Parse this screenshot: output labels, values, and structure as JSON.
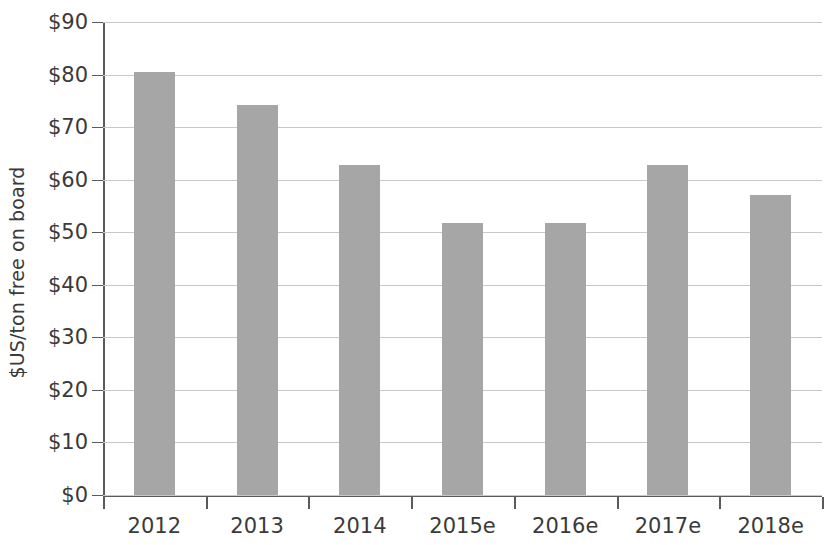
{
  "chart_data": {
    "type": "bar",
    "title": "",
    "xlabel": "",
    "ylabel": "$US/ton free on board",
    "categories": [
      "2012",
      "2013",
      "2014",
      "2015e",
      "2016e",
      "2017e",
      "2018e"
    ],
    "values": [
      80.5,
      74.3,
      62.7,
      51.8,
      51.8,
      62.7,
      57.0
    ],
    "ylim": [
      0,
      90
    ],
    "ytick_step": 10,
    "ytick_labels": [
      "$90",
      "$80",
      "$70",
      "$60",
      "$50",
      "$40",
      "$30",
      "$20",
      "$10",
      "$0"
    ],
    "ytick_values": [
      90,
      80,
      70,
      60,
      50,
      40,
      30,
      20,
      10,
      0
    ],
    "grid": true,
    "legend": false,
    "legend_position": "none",
    "series": [
      {
        "name": "Price",
        "values": [
          80.5,
          74.3,
          62.7,
          51.8,
          51.8,
          62.7,
          57.0
        ]
      }
    ],
    "colors": {
      "bar_fill": "#a6a6a6",
      "gridline": "#c8c8c8",
      "axis": "#5a5a5a",
      "text": "#3a3a3a",
      "background": "#ffffff"
    }
  }
}
